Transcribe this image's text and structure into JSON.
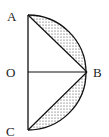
{
  "diagram": {
    "type": "geometry",
    "points": {
      "A": {
        "label": "A",
        "x": 28,
        "y": 15
      },
      "O": {
        "label": "O",
        "x": 28,
        "y": 72
      },
      "B": {
        "label": "B",
        "x": 87,
        "y": 72
      },
      "C": {
        "label": "C",
        "x": 28,
        "y": 130
      }
    },
    "segments": [
      "AC",
      "AB",
      "OB",
      "CB"
    ],
    "arc": "semicircle A-B-C",
    "shaded_regions": [
      "segment between chord AB and arc AB",
      "segment between chord CB and arc CB"
    ],
    "colors": {
      "stroke": "#111111",
      "dots": "#333333",
      "background": "#ffffff"
    }
  }
}
